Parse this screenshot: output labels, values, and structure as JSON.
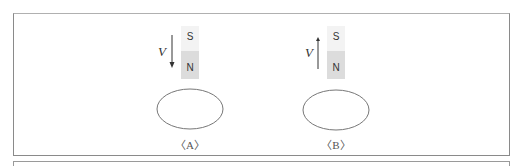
{
  "figure": {
    "panels": [
      {
        "id": "A",
        "caption": "〈A〉",
        "magnet": {
          "top_pole": "S",
          "bottom_pole": "N"
        },
        "velocity": {
          "label": "V",
          "direction": "down"
        }
      },
      {
        "id": "B",
        "caption": "〈B〉",
        "magnet": {
          "top_pole": "S",
          "bottom_pole": "N"
        },
        "velocity": {
          "label": "V",
          "direction": "up"
        }
      }
    ]
  }
}
